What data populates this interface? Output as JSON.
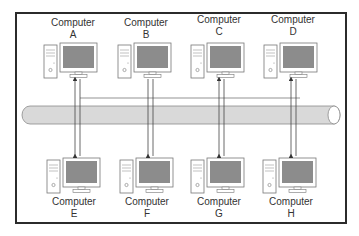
{
  "diagram": {
    "type": "bus-topology",
    "bus_label": "",
    "colors": {
      "frame": "#2b2b2b",
      "bus_fill": "#d9d9d9",
      "bus_stroke": "#8a8a8a",
      "screen": "#8c8c8c",
      "line": "#555555"
    },
    "top_row": [
      {
        "title": "Computer",
        "letter": "A"
      },
      {
        "title": "Computer",
        "letter": "B"
      },
      {
        "title": "Computer",
        "letter": "C"
      },
      {
        "title": "Computer",
        "letter": "D"
      }
    ],
    "bottom_row": [
      {
        "title": "Computer",
        "letter": "E"
      },
      {
        "title": "Computer",
        "letter": "F"
      },
      {
        "title": "Computer",
        "letter": "G"
      },
      {
        "title": "Computer",
        "letter": "H"
      }
    ]
  }
}
